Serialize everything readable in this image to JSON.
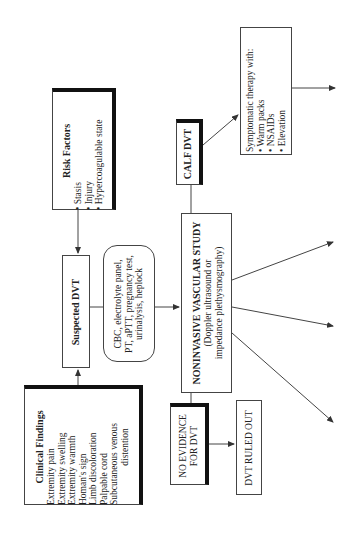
{
  "diagram": {
    "clinical_findings": {
      "title": "Clinical Findings",
      "items": [
        "Extremity pain",
        "Extremity swelling",
        "Extremity warmth",
        "Homan's sign",
        "Limb discoloration",
        "Palpable cord",
        "Subcutaneous venous",
        "distention"
      ]
    },
    "risk_factors": {
      "title": "Risk Factors",
      "items": [
        "• Stasis",
        "• Injury",
        "• Hypercoagulable state"
      ]
    },
    "suspected_dvt": {
      "title": "Suspected DVT"
    },
    "labs": {
      "lines": [
        "CBC, electrolyte panel,",
        "PT, aPTT, pregnancy test,",
        "urinalysis, heplock"
      ]
    },
    "vascular_study": {
      "title": "NONINVASIVE VASCULAR STUDY",
      "lines": [
        "(Doppler ultrasound or",
        "impedance plethysmography)"
      ]
    },
    "calf_dvt": {
      "title": "CALF DVT"
    },
    "symptomatic": {
      "title": "Symptomatic therapy with:",
      "items": [
        "• Warm packs",
        "• NSAIDs",
        "• Elevation"
      ]
    },
    "no_evidence": {
      "lines": [
        "NO EVIDENCE",
        "FOR DVT"
      ]
    },
    "ruled_out": {
      "title": "DVT RULED OUT"
    }
  },
  "colors": {
    "line": "#444444",
    "shadow": "#111111",
    "background": "#ffffff"
  }
}
